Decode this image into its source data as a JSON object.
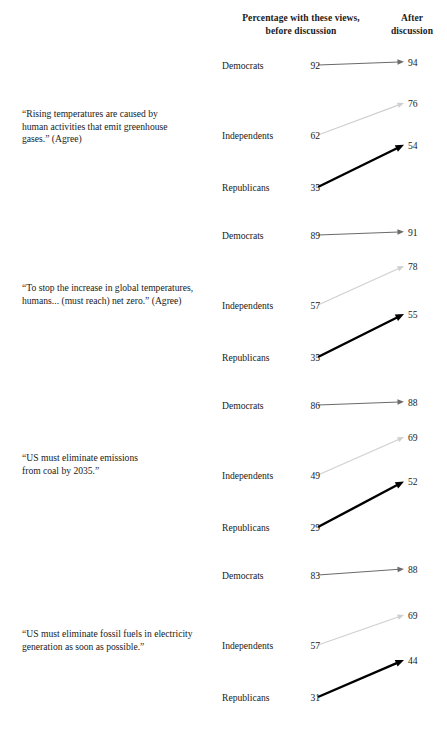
{
  "header": {
    "before_label": "Percentage with these views,\nbefore discussion",
    "before_line1": "Percentage with these views,",
    "before_line2": "before discussion",
    "after_line1": "After",
    "after_line2": "discussion"
  },
  "colors": {
    "democrats": "#6b6b6b",
    "independents": "#cfcfcf",
    "republicans": "#000000",
    "text": "#1a1a1a",
    "background": "#ffffff"
  },
  "chart_data": {
    "type": "line",
    "title": "",
    "subtitle": "",
    "xlabel": "",
    "ylabel": "",
    "x": [
      "before discussion",
      "after discussion"
    ],
    "legend": [
      "Democrats",
      "Independents",
      "Republicans"
    ],
    "legend_position": "inline-row-labels",
    "grid": false,
    "note": "Slope/arrow chart: each question shows before-discussion and after-discussion percentage agreement by party affiliation.",
    "groups": [
      {
        "question": "“Rising temperatures are caused by human activities that emit greenhouse gases.” (Agree)",
        "question_lines": [
          "“Rising temperatures are caused by",
          "human activities that emit greenhouse",
          "gases.” (Agree)"
        ],
        "rows": [
          {
            "party": "Democrats",
            "before": 92,
            "after": 94
          },
          {
            "party": "Independents",
            "before": 62,
            "after": 76
          },
          {
            "party": "Republicans",
            "before": 35,
            "after": 54
          }
        ]
      },
      {
        "question": "“To stop the increase in global temperatures, humans... (must reach) net zero.” (Agree)",
        "question_lines": [
          "“To stop the increase in global temperatures,",
          "humans... (must reach) net zero.” (Agree)"
        ],
        "rows": [
          {
            "party": "Democrats",
            "before": 89,
            "after": 91
          },
          {
            "party": "Independents",
            "before": 57,
            "after": 78
          },
          {
            "party": "Republicans",
            "before": 35,
            "after": 55
          }
        ]
      },
      {
        "question": "“US must eliminate emissions from coal by 2035.”",
        "question_lines": [
          "“US must eliminate emissions",
          "from coal by 2035.”"
        ],
        "rows": [
          {
            "party": "Democrats",
            "before": 86,
            "after": 88
          },
          {
            "party": "Independents",
            "before": 49,
            "after": 69
          },
          {
            "party": "Republicans",
            "before": 29,
            "after": 52
          }
        ]
      },
      {
        "question": "“US must eliminate fossil fuels in electricity generation as soon as possible.”",
        "question_lines": [
          "“US must eliminate fossil fuels in electricity",
          "generation as soon as possible.”"
        ],
        "rows": [
          {
            "party": "Democrats",
            "before": 83,
            "after": 88
          },
          {
            "party": "Independents",
            "before": 57,
            "after": 69
          },
          {
            "party": "Republicans",
            "before": 31,
            "after": 44
          }
        ]
      }
    ]
  }
}
